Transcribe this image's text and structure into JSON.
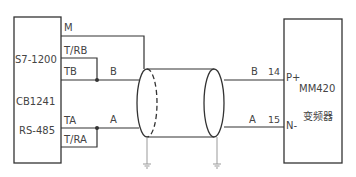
{
  "plc_block": {
    "lines": [
      "S7-1200",
      "CB1241",
      "RS-485"
    ],
    "terminals": [
      "M",
      "T/RB",
      "TB",
      "TA",
      "T/RA"
    ]
  },
  "signals": {
    "b": "B",
    "a": "A"
  },
  "drive_block": {
    "terminals": [
      {
        "num": "14",
        "name": "P+",
        "signal": "B"
      },
      {
        "num": "15",
        "name": "N-",
        "signal": "A"
      }
    ],
    "model": "MM420",
    "type": "变频器"
  },
  "colors": {
    "line": "#333333",
    "text": "#444444",
    "ground": "#999999"
  }
}
